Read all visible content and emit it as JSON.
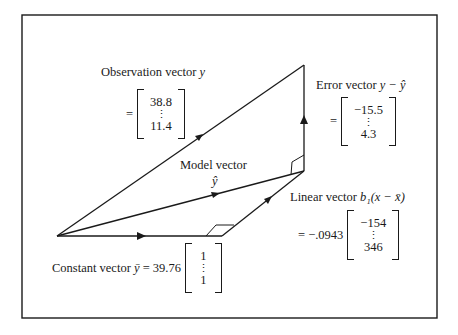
{
  "frame": {
    "x": 22,
    "y": 15,
    "width": 415,
    "height": 303,
    "stroke": "#1a1a1a"
  },
  "points": {
    "origin": [
      57,
      236
    ],
    "observation_tip": [
      304,
      65
    ],
    "model_tip": [
      304,
      171
    ],
    "constant_tip": [
      222,
      236
    ]
  },
  "labels": {
    "observation": {
      "title": "Observation vector ",
      "var": "y",
      "prefix": "=",
      "top": "38.8",
      "dots": "⋮",
      "bottom": "11.4"
    },
    "error": {
      "title": "Error vector ",
      "var": "y − ŷ",
      "prefix": "=",
      "top": "−15.5",
      "dots": "⋮",
      "bottom": "4.3"
    },
    "model": {
      "title": "Model vector",
      "var": "ŷ"
    },
    "linear": {
      "title": "Linear vector ",
      "var": "b₁(x − x̄)",
      "prefix": "= −.0943",
      "top": "−154",
      "dots": "⋮",
      "bottom": "346"
    },
    "constant": {
      "title": "Constant vector ",
      "var": "ȳ",
      "eq": " = 39.76",
      "top": "1",
      "dots": "⋮",
      "bottom": "1"
    }
  }
}
